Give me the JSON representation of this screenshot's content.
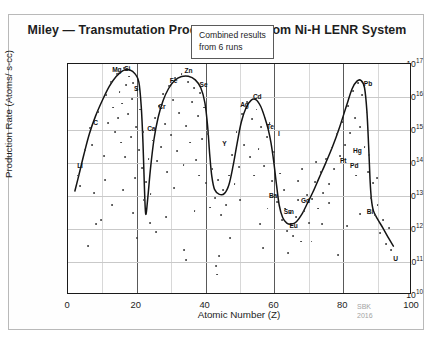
{
  "figure": {
    "title": "Miley — Transmutation Product Yields From Ni-H LENR System",
    "watermark_line1": "SBK",
    "watermark_line2": "2016",
    "annotation_line1": "Combined results",
    "annotation_line2": "from 6 runs"
  },
  "chart_data": {
    "type": "scatter",
    "title": "Miley — Transmutation Product Yields From Ni-H LENR System",
    "xlabel": "Atomic Number (Z)",
    "ylabel": "Production Rate (Atoms/ s-cc)",
    "xlim": [
      0,
      100
    ],
    "ylim_log10": [
      10,
      17
    ],
    "yscale": "log",
    "grid": true,
    "legend": null,
    "annotations": [
      {
        "text": "Combined results from 6 runs",
        "x": 55,
        "y_log10": 16.3,
        "boxed": true
      },
      {
        "text": "SBK 2016",
        "x": 88,
        "y_log10": 9.6,
        "watermark": true
      }
    ],
    "xticks": [
      0,
      20,
      40,
      60,
      80,
      100
    ],
    "xtick_labels": [
      "0",
      "20",
      "40",
      "60",
      "80",
      "100"
    ],
    "yticks_log10": [
      10,
      11,
      12,
      13,
      14,
      15,
      16,
      17
    ],
    "ytick_labels": [
      "10",
      "10",
      "10",
      "10",
      "10",
      "10",
      "10",
      "10"
    ],
    "ytick_exponents": [
      "10",
      "11",
      "12",
      "13",
      "14",
      "15",
      "16",
      "17"
    ],
    "element_labels": [
      {
        "symbol": "Li",
        "z": 3,
        "x": 3.5,
        "y_log10": 13.95
      },
      {
        "symbol": "C",
        "z": 6,
        "x": 8.0,
        "y_log10": 15.25
      },
      {
        "symbol": "Mg",
        "z": 12,
        "x": 14.2,
        "y_log10": 16.85
      },
      {
        "symbol": "Si",
        "z": 14,
        "x": 17.2,
        "y_log10": 16.88
      },
      {
        "symbol": "S",
        "z": 16,
        "x": 19.8,
        "y_log10": 16.28
      },
      {
        "symbol": "Ca",
        "z": 20,
        "x": 24.2,
        "y_log10": 15.05
      },
      {
        "symbol": "Cr",
        "z": 24,
        "x": 27.3,
        "y_log10": 15.72
      },
      {
        "symbol": "Fe",
        "z": 26,
        "x": 30.7,
        "y_log10": 16.52
      },
      {
        "symbol": "Zn",
        "z": 30,
        "x": 35.0,
        "y_log10": 16.82
      },
      {
        "symbol": "Se",
        "z": 34,
        "x": 39.4,
        "y_log10": 16.38
      },
      {
        "symbol": "Y",
        "z": 39,
        "x": 45.5,
        "y_log10": 14.62
      },
      {
        "symbol": "Ag",
        "z": 47,
        "x": 51.3,
        "y_log10": 15.78
      },
      {
        "symbol": "Cd",
        "z": 48,
        "x": 55.0,
        "y_log10": 16.02
      },
      {
        "symbol": "Te",
        "z": 52,
        "x": 58.8,
        "y_log10": 15.12
      },
      {
        "symbol": "I",
        "z": 53,
        "x": 61.3,
        "y_log10": 14.92
      },
      {
        "symbol": "Ba",
        "z": 56,
        "x": 59.6,
        "y_log10": 13.02
      },
      {
        "symbol": "Sm",
        "z": 62,
        "x": 64.2,
        "y_log10": 12.55
      },
      {
        "symbol": "Eu",
        "z": 63,
        "x": 65.6,
        "y_log10": 12.12
      },
      {
        "symbol": "Gd",
        "z": 64,
        "x": 69.0,
        "y_log10": 12.88
      },
      {
        "symbol": "Pt",
        "z": 78,
        "x": 80.0,
        "y_log10": 14.08
      },
      {
        "symbol": "Hg",
        "z": 80,
        "x": 84.1,
        "y_log10": 14.4
      },
      {
        "symbol": "Pd",
        "z": 46,
        "x": 83.2,
        "y_log10": 13.95
      },
      {
        "symbol": "Pb",
        "z": 82,
        "x": 87.2,
        "y_log10": 16.42
      },
      {
        "symbol": "Bi",
        "z": 83,
        "x": 87.8,
        "y_log10": 12.55
      },
      {
        "symbol": "U",
        "z": 92,
        "x": 95.2,
        "y_log10": 11.12
      }
    ],
    "trend_curve": [
      {
        "x": 2.0,
        "y_log10": 13.15
      },
      {
        "x": 3.2,
        "y_log10": 13.65
      },
      {
        "x": 4.6,
        "y_log10": 14.25
      },
      {
        "x": 6.2,
        "y_log10": 14.88
      },
      {
        "x": 8.0,
        "y_log10": 15.42
      },
      {
        "x": 10.0,
        "y_log10": 15.9
      },
      {
        "x": 12.0,
        "y_log10": 16.32
      },
      {
        "x": 14.0,
        "y_log10": 16.62
      },
      {
        "x": 16.0,
        "y_log10": 16.8
      },
      {
        "x": 18.0,
        "y_log10": 16.82
      },
      {
        "x": 19.5,
        "y_log10": 16.7
      },
      {
        "x": 20.6,
        "y_log10": 16.45
      },
      {
        "x": 21.3,
        "y_log10": 15.7
      },
      {
        "x": 21.8,
        "y_log10": 14.6
      },
      {
        "x": 22.2,
        "y_log10": 13.3
      },
      {
        "x": 22.6,
        "y_log10": 12.45
      },
      {
        "x": 23.2,
        "y_log10": 12.95
      },
      {
        "x": 24.0,
        "y_log10": 13.85
      },
      {
        "x": 25.0,
        "y_log10": 14.72
      },
      {
        "x": 26.2,
        "y_log10": 15.38
      },
      {
        "x": 27.6,
        "y_log10": 15.88
      },
      {
        "x": 29.2,
        "y_log10": 16.25
      },
      {
        "x": 31.0,
        "y_log10": 16.5
      },
      {
        "x": 33.0,
        "y_log10": 16.62
      },
      {
        "x": 35.0,
        "y_log10": 16.63
      },
      {
        "x": 37.0,
        "y_log10": 16.52
      },
      {
        "x": 38.6,
        "y_log10": 16.28
      },
      {
        "x": 39.8,
        "y_log10": 15.82
      },
      {
        "x": 40.6,
        "y_log10": 15.1
      },
      {
        "x": 41.2,
        "y_log10": 14.25
      },
      {
        "x": 41.8,
        "y_log10": 13.6
      },
      {
        "x": 42.6,
        "y_log10": 13.2
      },
      {
        "x": 44.0,
        "y_log10": 13.05
      },
      {
        "x": 45.5,
        "y_log10": 13.08
      },
      {
        "x": 46.8,
        "y_log10": 13.35
      },
      {
        "x": 48.0,
        "y_log10": 13.92
      },
      {
        "x": 49.2,
        "y_log10": 14.62
      },
      {
        "x": 50.4,
        "y_log10": 15.25
      },
      {
        "x": 51.8,
        "y_log10": 15.68
      },
      {
        "x": 53.2,
        "y_log10": 15.9
      },
      {
        "x": 54.6,
        "y_log10": 15.92
      },
      {
        "x": 56.0,
        "y_log10": 15.72
      },
      {
        "x": 57.2,
        "y_log10": 15.38
      },
      {
        "x": 58.2,
        "y_log10": 15.02
      },
      {
        "x": 59.0,
        "y_log10": 14.62
      },
      {
        "x": 59.8,
        "y_log10": 14.05
      },
      {
        "x": 60.6,
        "y_log10": 13.35
      },
      {
        "x": 61.4,
        "y_log10": 12.72
      },
      {
        "x": 62.4,
        "y_log10": 12.35
      },
      {
        "x": 63.6,
        "y_log10": 12.18
      },
      {
        "x": 65.0,
        "y_log10": 12.15
      },
      {
        "x": 66.4,
        "y_log10": 12.22
      },
      {
        "x": 68.0,
        "y_log10": 12.45
      },
      {
        "x": 69.6,
        "y_log10": 12.78
      },
      {
        "x": 71.2,
        "y_log10": 13.12
      },
      {
        "x": 73.0,
        "y_log10": 13.55
      },
      {
        "x": 75.0,
        "y_log10": 14.02
      },
      {
        "x": 77.0,
        "y_log10": 14.52
      },
      {
        "x": 79.0,
        "y_log10": 15.1
      },
      {
        "x": 81.0,
        "y_log10": 15.75
      },
      {
        "x": 82.6,
        "y_log10": 16.25
      },
      {
        "x": 84.0,
        "y_log10": 16.48
      },
      {
        "x": 85.2,
        "y_log10": 16.5
      },
      {
        "x": 86.2,
        "y_log10": 16.28
      },
      {
        "x": 86.9,
        "y_log10": 15.55
      },
      {
        "x": 87.4,
        "y_log10": 14.5
      },
      {
        "x": 87.8,
        "y_log10": 13.5
      },
      {
        "x": 88.2,
        "y_log10": 12.9
      },
      {
        "x": 88.8,
        "y_log10": 12.55
      },
      {
        "x": 90.0,
        "y_log10": 12.3
      },
      {
        "x": 91.6,
        "y_log10": 12.02
      },
      {
        "x": 93.2,
        "y_log10": 11.72
      },
      {
        "x": 94.6,
        "y_log10": 11.48
      }
    ],
    "scatter_points": [
      {
        "x": 3.0,
        "y_log10": 13.62
      },
      {
        "x": 3.6,
        "y_log10": 13.3
      },
      {
        "x": 5.0,
        "y_log10": 14.38
      },
      {
        "x": 6.4,
        "y_log10": 15.05
      },
      {
        "x": 7.0,
        "y_log10": 14.55
      },
      {
        "x": 7.6,
        "y_log10": 13.1
      },
      {
        "x": 8.8,
        "y_log10": 15.55
      },
      {
        "x": 9.5,
        "y_log10": 12.28
      },
      {
        "x": 10.4,
        "y_log10": 14.22
      },
      {
        "x": 11.0,
        "y_log10": 16.05
      },
      {
        "x": 11.6,
        "y_log10": 15.22
      },
      {
        "x": 12.4,
        "y_log10": 16.45
      },
      {
        "x": 13.0,
        "y_log10": 15.68
      },
      {
        "x": 13.6,
        "y_log10": 14.95
      },
      {
        "x": 14.2,
        "y_log10": 16.7
      },
      {
        "x": 14.6,
        "y_log10": 15.35
      },
      {
        "x": 15.0,
        "y_log10": 16.15
      },
      {
        "x": 15.4,
        "y_log10": 14.62
      },
      {
        "x": 15.8,
        "y_log10": 15.8
      },
      {
        "x": 16.2,
        "y_log10": 16.88
      },
      {
        "x": 16.6,
        "y_log10": 14.18
      },
      {
        "x": 17.0,
        "y_log10": 16.35
      },
      {
        "x": 17.4,
        "y_log10": 15.48
      },
      {
        "x": 17.8,
        "y_log10": 16.62
      },
      {
        "x": 18.2,
        "y_log10": 14.78
      },
      {
        "x": 18.6,
        "y_log10": 15.95
      },
      {
        "x": 19.0,
        "y_log10": 16.42
      },
      {
        "x": 19.4,
        "y_log10": 13.55
      },
      {
        "x": 19.8,
        "y_log10": 15.08
      },
      {
        "x": 20.2,
        "y_log10": 16.2
      },
      {
        "x": 20.6,
        "y_log10": 14.4
      },
      {
        "x": 21.0,
        "y_log10": 15.62
      },
      {
        "x": 21.4,
        "y_log10": 13.85
      },
      {
        "x": 21.8,
        "y_log10": 14.95
      },
      {
        "x": 22.2,
        "y_log10": 12.88
      },
      {
        "x": 22.8,
        "y_log10": 13.42
      },
      {
        "x": 23.4,
        "y_log10": 14.12
      },
      {
        "x": 24.0,
        "y_log10": 13.05
      },
      {
        "x": 24.6,
        "y_log10": 14.68
      },
      {
        "x": 25.2,
        "y_log10": 15.35
      },
      {
        "x": 25.8,
        "y_log10": 14.05
      },
      {
        "x": 26.4,
        "y_log10": 15.72
      },
      {
        "x": 27.0,
        "y_log10": 14.48
      },
      {
        "x": 27.6,
        "y_log10": 16.08
      },
      {
        "x": 28.2,
        "y_log10": 15.18
      },
      {
        "x": 28.8,
        "y_log10": 13.72
      },
      {
        "x": 29.4,
        "y_log10": 16.32
      },
      {
        "x": 30.0,
        "y_log10": 14.85
      },
      {
        "x": 30.6,
        "y_log10": 15.92
      },
      {
        "x": 31.2,
        "y_log10": 16.58
      },
      {
        "x": 31.8,
        "y_log10": 14.35
      },
      {
        "x": 32.4,
        "y_log10": 15.52
      },
      {
        "x": 33.0,
        "y_log10": 16.7
      },
      {
        "x": 33.6,
        "y_log10": 13.95
      },
      {
        "x": 34.2,
        "y_log10": 15.12
      },
      {
        "x": 34.8,
        "y_log10": 16.45
      },
      {
        "x": 35.4,
        "y_log10": 14.62
      },
      {
        "x": 36.0,
        "y_log10": 15.85
      },
      {
        "x": 36.6,
        "y_log10": 16.28
      },
      {
        "x": 37.2,
        "y_log10": 14.08
      },
      {
        "x": 37.8,
        "y_log10": 15.42
      },
      {
        "x": 38.4,
        "y_log10": 16.12
      },
      {
        "x": 39.0,
        "y_log10": 14.72
      },
      {
        "x": 39.6,
        "y_log10": 15.68
      },
      {
        "x": 40.2,
        "y_log10": 13.38
      },
      {
        "x": 40.8,
        "y_log10": 14.88
      },
      {
        "x": 41.4,
        "y_log10": 12.65
      },
      {
        "x": 42.0,
        "y_log10": 13.82
      },
      {
        "x": 42.8,
        "y_log10": 12.95
      },
      {
        "x": 43.6,
        "y_log10": 13.48
      },
      {
        "x": 44.4,
        "y_log10": 12.42
      },
      {
        "x": 45.2,
        "y_log10": 13.18
      },
      {
        "x": 46.0,
        "y_log10": 12.72
      },
      {
        "x": 46.8,
        "y_log10": 13.62
      },
      {
        "x": 47.6,
        "y_log10": 14.25
      },
      {
        "x": 48.4,
        "y_log10": 13.35
      },
      {
        "x": 49.0,
        "y_log10": 14.95
      },
      {
        "x": 49.8,
        "y_log10": 13.88
      },
      {
        "x": 50.6,
        "y_log10": 15.48
      },
      {
        "x": 51.2,
        "y_log10": 14.55
      },
      {
        "x": 52.0,
        "y_log10": 15.85
      },
      {
        "x": 52.8,
        "y_log10": 14.18
      },
      {
        "x": 53.4,
        "y_log10": 15.32
      },
      {
        "x": 54.0,
        "y_log10": 13.62
      },
      {
        "x": 54.8,
        "y_log10": 15.62
      },
      {
        "x": 55.4,
        "y_log10": 14.42
      },
      {
        "x": 56.2,
        "y_log10": 15.08
      },
      {
        "x": 57.0,
        "y_log10": 13.92
      },
      {
        "x": 57.8,
        "y_log10": 14.78
      },
      {
        "x": 58.6,
        "y_log10": 15.22
      },
      {
        "x": 59.2,
        "y_log10": 13.45
      },
      {
        "x": 60.0,
        "y_log10": 14.32
      },
      {
        "x": 60.8,
        "y_log10": 12.82
      },
      {
        "x": 61.6,
        "y_log10": 13.68
      },
      {
        "x": 62.2,
        "y_log10": 12.28
      },
      {
        "x": 63.0,
        "y_log10": 12.62
      },
      {
        "x": 63.8,
        "y_log10": 11.95
      },
      {
        "x": 64.6,
        "y_log10": 12.48
      },
      {
        "x": 65.4,
        "y_log10": 11.78
      },
      {
        "x": 66.2,
        "y_log10": 12.35
      },
      {
        "x": 67.0,
        "y_log10": 12.88
      },
      {
        "x": 67.8,
        "y_log10": 11.62
      },
      {
        "x": 68.6,
        "y_log10": 12.55
      },
      {
        "x": 69.4,
        "y_log10": 13.02
      },
      {
        "x": 70.2,
        "y_log10": 12.18
      },
      {
        "x": 71.0,
        "y_log10": 12.92
      },
      {
        "x": 71.8,
        "y_log10": 13.42
      },
      {
        "x": 72.6,
        "y_log10": 12.62
      },
      {
        "x": 73.4,
        "y_log10": 13.72
      },
      {
        "x": 74.2,
        "y_log10": 13.08
      },
      {
        "x": 75.0,
        "y_log10": 14.12
      },
      {
        "x": 75.8,
        "y_log10": 13.35
      },
      {
        "x": 76.6,
        "y_log10": 14.45
      },
      {
        "x": 77.4,
        "y_log10": 13.82
      },
      {
        "x": 78.2,
        "y_log10": 14.88
      },
      {
        "x": 79.0,
        "y_log10": 14.22
      },
      {
        "x": 79.8,
        "y_log10": 15.25
      },
      {
        "x": 80.6,
        "y_log10": 14.55
      },
      {
        "x": 81.4,
        "y_log10": 15.72
      },
      {
        "x": 82.0,
        "y_log10": 14.92
      },
      {
        "x": 82.8,
        "y_log10": 16.18
      },
      {
        "x": 83.4,
        "y_log10": 15.35
      },
      {
        "x": 84.2,
        "y_log10": 16.42
      },
      {
        "x": 84.8,
        "y_log10": 15.08
      },
      {
        "x": 85.6,
        "y_log10": 16.05
      },
      {
        "x": 86.2,
        "y_log10": 14.48
      },
      {
        "x": 86.8,
        "y_log10": 15.55
      },
      {
        "x": 87.2,
        "y_log10": 13.72
      },
      {
        "x": 87.6,
        "y_log10": 14.25
      },
      {
        "x": 88.0,
        "y_log10": 12.95
      },
      {
        "x": 88.6,
        "y_log10": 13.38
      },
      {
        "x": 89.2,
        "y_log10": 12.42
      },
      {
        "x": 90.0,
        "y_log10": 12.72
      },
      {
        "x": 90.8,
        "y_log10": 11.88
      },
      {
        "x": 91.6,
        "y_log10": 12.28
      },
      {
        "x": 92.4,
        "y_log10": 11.55
      },
      {
        "x": 93.2,
        "y_log10": 12.02
      },
      {
        "x": 94.0,
        "y_log10": 11.35
      },
      {
        "x": 25.5,
        "y_log10": 11.92
      },
      {
        "x": 33.8,
        "y_log10": 11.35
      },
      {
        "x": 34.4,
        "y_log10": 11.05
      },
      {
        "x": 18.8,
        "y_log10": 12.48
      },
      {
        "x": 12.8,
        "y_log10": 12.72
      },
      {
        "x": 8.2,
        "y_log10": 12.15
      },
      {
        "x": 5.8,
        "y_log10": 11.48
      },
      {
        "x": 47.2,
        "y_log10": 11.72
      },
      {
        "x": 55.8,
        "y_log10": 12.15
      },
      {
        "x": 64.0,
        "y_log10": 11.28
      },
      {
        "x": 70.8,
        "y_log10": 11.62
      },
      {
        "x": 78.6,
        "y_log10": 11.22
      },
      {
        "x": 28.4,
        "y_log10": 12.35
      },
      {
        "x": 36.8,
        "y_log10": 12.55
      },
      {
        "x": 44.0,
        "y_log10": 11.18
      },
      {
        "x": 58.0,
        "y_log10": 12.62
      },
      {
        "x": 66.8,
        "y_log10": 13.45
      },
      {
        "x": 73.8,
        "y_log10": 12.15
      },
      {
        "x": 81.0,
        "y_log10": 12.08
      },
      {
        "x": 85.0,
        "y_log10": 12.45
      },
      {
        "x": 10.8,
        "y_log10": 13.48
      },
      {
        "x": 16.0,
        "y_log10": 13.18
      },
      {
        "x": 20.0,
        "y_log10": 11.72
      },
      {
        "x": 23.8,
        "y_log10": 12.18
      },
      {
        "x": 30.8,
        "y_log10": 13.25
      },
      {
        "x": 38.0,
        "y_log10": 13.62
      },
      {
        "x": 43.0,
        "y_log10": 10.88
      },
      {
        "x": 43.4,
        "y_log10": 10.62
      },
      {
        "x": 50.0,
        "y_log10": 12.88
      },
      {
        "x": 56.8,
        "y_log10": 11.42
      },
      {
        "x": 62.8,
        "y_log10": 13.18
      },
      {
        "x": 68.0,
        "y_log10": 13.82
      },
      {
        "x": 72.2,
        "y_log10": 14.02
      },
      {
        "x": 76.0,
        "y_log10": 12.78
      },
      {
        "x": 83.8,
        "y_log10": 13.62
      },
      {
        "x": 89.8,
        "y_log10": 13.55
      }
    ]
  },
  "axes": {
    "xlabel": "Atomic Number (Z)",
    "ylabel": "Production Rate (Atoms/ s-cc)"
  }
}
